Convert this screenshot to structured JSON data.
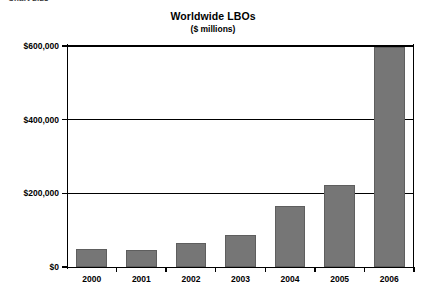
{
  "caption_fragment": "Chart 2.23",
  "chart_data": {
    "type": "bar",
    "title": "Worldwide LBOs",
    "subtitle": "($ millions)",
    "xlabel": "",
    "ylabel": "",
    "categories": [
      "2000",
      "2001",
      "2002",
      "2003",
      "2004",
      "2005",
      "2006"
    ],
    "values": [
      50000,
      45000,
      65000,
      88000,
      165000,
      222000,
      596000
    ],
    "series": [
      {
        "name": "Worldwide LBOs",
        "values": [
          50000,
          45000,
          65000,
          88000,
          165000,
          222000,
          596000
        ]
      }
    ],
    "ylim": [
      0,
      600000
    ],
    "ytick_values": [
      0,
      200000,
      400000,
      600000
    ],
    "ytick_labels": [
      "$0",
      "$200,000",
      "$400,000",
      "$600,000"
    ],
    "grid": true,
    "legend": false,
    "legend_position": "none",
    "bar_color": "#767676",
    "bar_edge_color": "#5e5e5e",
    "axis_color": "#000000",
    "background_color": "#ffffff"
  }
}
